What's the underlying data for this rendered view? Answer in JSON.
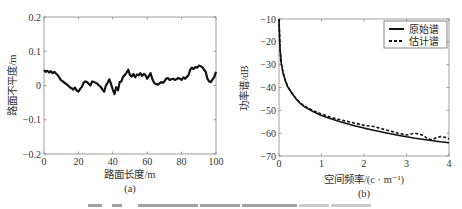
{
  "figure": {
    "caption_visible": false
  },
  "chart_data": [
    {
      "id": "a",
      "type": "line",
      "panel_label": "(a)",
      "title": "",
      "xlabel": "路面长度/m",
      "ylabel": "路面不平度/m",
      "xlim": [
        0,
        100
      ],
      "ylim": [
        -0.2,
        0.2
      ],
      "xticks": [
        0,
        20,
        40,
        60,
        80,
        100
      ],
      "xtick_labels": [
        "0",
        "20",
        "40",
        "60",
        "80",
        "100"
      ],
      "yticks": [
        0.2,
        0.1,
        0,
        -0.1,
        -0.2
      ],
      "ytick_labels": [
        "0.2",
        "0.1",
        "0",
        "−0.1",
        "−0.2"
      ],
      "grid": false,
      "series": [
        {
          "name": "路面不平度",
          "style": "solid",
          "color": "#111111",
          "x": [
            0,
            1,
            2,
            3,
            4,
            5,
            6,
            7,
            8,
            9,
            10,
            11,
            12,
            13,
            14,
            15,
            16,
            17,
            18,
            19,
            20,
            21,
            22,
            23,
            24,
            25,
            26,
            27,
            28,
            29,
            30,
            31,
            32,
            33,
            34,
            35,
            36,
            37,
            38,
            39,
            40,
            41,
            42,
            43,
            44,
            45,
            46,
            47,
            48,
            49,
            50,
            51,
            52,
            53,
            54,
            55,
            56,
            57,
            58,
            59,
            60,
            61,
            62,
            63,
            64,
            65,
            66,
            67,
            68,
            69,
            70,
            71,
            72,
            73,
            74,
            75,
            76,
            77,
            78,
            79,
            80,
            81,
            82,
            83,
            84,
            85,
            86,
            87,
            88,
            89,
            90,
            91,
            92,
            93,
            94,
            95,
            96,
            97,
            98,
            99,
            100
          ],
          "y": [
            0.045,
            0.04,
            0.043,
            0.038,
            0.042,
            0.036,
            0.04,
            0.035,
            0.03,
            0.022,
            0.015,
            0.012,
            0.008,
            0.004,
            0.0,
            -0.005,
            -0.008,
            -0.012,
            -0.006,
            -0.015,
            -0.018,
            -0.01,
            -0.004,
            0.008,
            0.012,
            0.01,
            0.005,
            0.0,
            0.012,
            0.01,
            0.008,
            0.005,
            0.0,
            -0.004,
            -0.012,
            -0.018,
            0.0,
            0.008,
            0.018,
            0.004,
            -0.012,
            -0.025,
            -0.005,
            -0.014,
            0.01,
            0.012,
            0.026,
            0.03,
            0.038,
            0.046,
            0.03,
            0.026,
            0.034,
            0.024,
            0.032,
            0.03,
            0.036,
            0.028,
            0.034,
            0.03,
            0.02,
            0.028,
            0.036,
            0.018,
            0.008,
            0.004,
            0.002,
            0.005,
            0.01,
            0.008,
            0.012,
            0.02,
            0.022,
            0.016,
            0.018,
            0.02,
            0.016,
            0.018,
            0.022,
            0.02,
            0.016,
            0.024,
            0.02,
            0.025,
            0.03,
            0.046,
            0.052,
            0.048,
            0.054,
            0.052,
            0.058,
            0.056,
            0.054,
            0.046,
            0.04,
            0.02,
            0.012,
            0.01,
            0.018,
            0.025,
            0.04
          ]
        }
      ]
    },
    {
      "id": "b",
      "type": "line",
      "panel_label": "(b)",
      "title": "",
      "xlabel": "空间频率/(c · m⁻¹)",
      "ylabel": "功率谱/dB",
      "xlim": [
        0,
        4
      ],
      "ylim": [
        -70,
        -10
      ],
      "xticks": [
        0,
        1,
        2,
        3,
        4
      ],
      "xtick_labels": [
        "0",
        "1",
        "2",
        "3",
        "4"
      ],
      "yticks": [
        -10,
        -20,
        -30,
        -40,
        -50,
        -60,
        -70
      ],
      "ytick_labels": [
        "−10",
        "−20",
        "−30",
        "−40",
        "−50",
        "−60",
        "−70"
      ],
      "grid": false,
      "legend": {
        "position": "top-right",
        "boxed": true
      },
      "series": [
        {
          "name": "原始谱",
          "style": "solid",
          "color": "#111111",
          "x": [
            0.0,
            0.02,
            0.05,
            0.1,
            0.15,
            0.2,
            0.3,
            0.4,
            0.5,
            0.6,
            0.8,
            1.0,
            1.2,
            1.5,
            1.8,
            2.0,
            2.2,
            2.5,
            2.8,
            3.0,
            3.2,
            3.5,
            3.8,
            4.0
          ],
          "y": [
            -10,
            -22,
            -29,
            -34,
            -37,
            -39.5,
            -42.5,
            -45,
            -47,
            -48.5,
            -50.5,
            -52.2,
            -53.6,
            -55.3,
            -56.8,
            -57.8,
            -58.6,
            -59.8,
            -60.9,
            -61.6,
            -62.2,
            -63.0,
            -63.8,
            -64.2
          ]
        },
        {
          "name": "估计谱",
          "style": "dashed",
          "color": "#111111",
          "x": [
            0.0,
            0.02,
            0.05,
            0.1,
            0.15,
            0.2,
            0.3,
            0.4,
            0.5,
            0.6,
            0.8,
            1.0,
            1.2,
            1.5,
            1.8,
            2.0,
            2.2,
            2.5,
            2.8,
            3.0,
            3.2,
            3.4,
            3.5,
            3.6,
            3.7,
            3.8,
            3.9,
            4.0
          ],
          "y": [
            -10,
            -22,
            -29,
            -34,
            -37,
            -39.5,
            -42.3,
            -44.8,
            -46.7,
            -48.1,
            -50.1,
            -51.6,
            -52.9,
            -54.4,
            -55.7,
            -56.6,
            -57.0,
            -58.5,
            -60.0,
            -60.8,
            -60.0,
            -61.0,
            -62.5,
            -62.8,
            -62.0,
            -61.5,
            -61.8,
            -62.5
          ]
        }
      ]
    }
  ]
}
